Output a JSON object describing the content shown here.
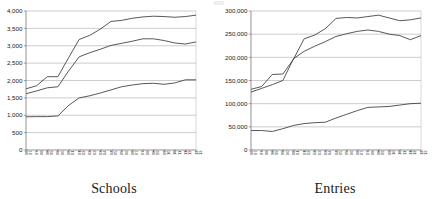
{
  "figure": {
    "panels": [
      {
        "id": "schools",
        "caption": "Schools"
      },
      {
        "id": "entries",
        "caption": "Entries"
      }
    ]
  },
  "chart_data": [
    {
      "type": "line",
      "title": "Schools",
      "xlabel": "",
      "ylabel": "",
      "grid": true,
      "legend": "none",
      "ylim": [
        0,
        4000
      ],
      "yticks": [
        0,
        500,
        1000,
        1500,
        2000,
        2500,
        3000,
        3500,
        4000
      ],
      "ytick_labels": [
        "0",
        "500",
        "1,000",
        "1,500",
        "2,000",
        "2,500",
        "3,000",
        "3,500",
        "4,000"
      ],
      "categories": [
        "96/97",
        "97/98",
        "98/99",
        "99/00",
        "00/01",
        "01/02",
        "02/03",
        "03/04",
        "04/05",
        "05/06",
        "06/07",
        "07/08",
        "08/09",
        "09/10",
        "10/11",
        "11/12",
        "12/13"
      ],
      "series": [
        {
          "name": "Series 1",
          "values": [
            1760,
            1850,
            2110,
            2110,
            2650,
            3180,
            3300,
            3480,
            3700,
            3730,
            3790,
            3830,
            3850,
            3840,
            3820,
            3840,
            3880
          ]
        },
        {
          "name": "Series 2",
          "values": [
            1620,
            1700,
            1790,
            1820,
            2270,
            2680,
            2800,
            2900,
            3010,
            3070,
            3130,
            3200,
            3200,
            3150,
            3080,
            3050,
            3110
          ]
        },
        {
          "name": "Series 3",
          "values": [
            955,
            960,
            960,
            980,
            1280,
            1500,
            1560,
            1640,
            1730,
            1820,
            1870,
            1910,
            1920,
            1890,
            1930,
            2020,
            2020
          ]
        }
      ]
    },
    {
      "type": "line",
      "title": "Entries",
      "xlabel": "",
      "ylabel": "",
      "grid": true,
      "legend": "none",
      "ylim": [
        0,
        300000
      ],
      "yticks": [
        0,
        50000,
        100000,
        150000,
        200000,
        250000,
        300000
      ],
      "ytick_labels": [
        "0",
        "50,000",
        "100,000",
        "150,000",
        "200,000",
        "250,000",
        "300,000"
      ],
      "categories": [
        "96/97",
        "97/98",
        "98/99",
        "99/00",
        "00/01",
        "01/02",
        "02/03",
        "03/04",
        "04/05",
        "05/06",
        "06/07",
        "07/08",
        "08/09",
        "09/10",
        "10/11",
        "11/12",
        "12/13"
      ],
      "series": [
        {
          "name": "Series 1",
          "values": [
            131000,
            137000,
            163000,
            164000,
            196000,
            240000,
            248000,
            262000,
            284000,
            286000,
            285000,
            288000,
            291000,
            285000,
            279000,
            281000,
            285000
          ]
        },
        {
          "name": "Series 2",
          "values": [
            125000,
            133000,
            141000,
            150000,
            197000,
            213000,
            224000,
            234000,
            245000,
            251000,
            256000,
            259000,
            256000,
            250000,
            247000,
            238000,
            247000
          ]
        },
        {
          "name": "Series 3",
          "values": [
            42000,
            42000,
            40000,
            46000,
            53000,
            57000,
            59000,
            60000,
            69000,
            77000,
            85000,
            92000,
            93000,
            94000,
            97000,
            100000,
            101000
          ]
        }
      ]
    }
  ]
}
